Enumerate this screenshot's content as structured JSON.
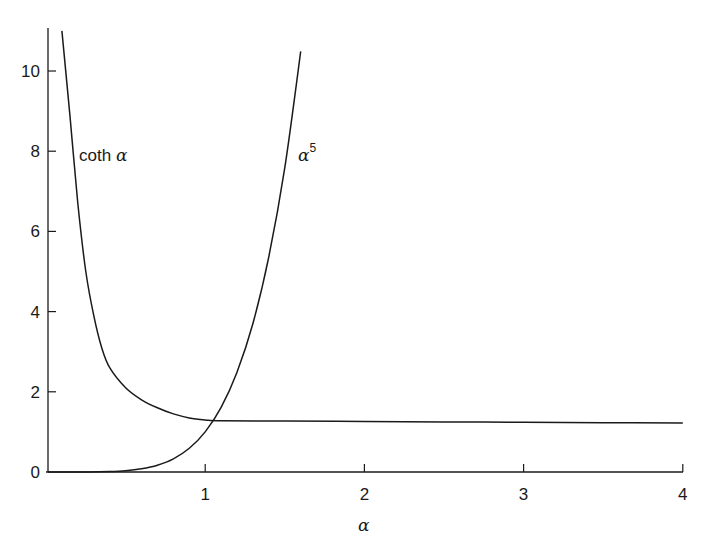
{
  "chart_data": {
    "type": "line",
    "title": "",
    "xlabel": "α",
    "ylabel": "",
    "xlim": [
      0,
      4
    ],
    "ylim": [
      0,
      11
    ],
    "grid": false,
    "legend": "none (inline curve labels)",
    "x_ticks": [
      "1",
      "2",
      "3",
      "4"
    ],
    "y_ticks": [
      "0",
      "2",
      "4",
      "6",
      "8",
      "10"
    ],
    "series": [
      {
        "name": "coth α",
        "label_text": "coth",
        "label_symbol": "α",
        "x": [
          0.1,
          0.15,
          0.2,
          0.25,
          0.3,
          0.35,
          0.4,
          0.5,
          0.6,
          0.7,
          0.8,
          0.9,
          1.0,
          1.1,
          1.5,
          2.0,
          2.5,
          3.0,
          3.5,
          4.0
        ],
        "y": [
          11.0,
          8.9,
          6.7,
          5.0,
          3.9,
          3.1,
          2.6,
          2.1,
          1.8,
          1.6,
          1.45,
          1.35,
          1.3,
          1.28,
          1.27,
          1.26,
          1.25,
          1.24,
          1.23,
          1.22
        ]
      },
      {
        "name": "α^5",
        "label_text": "α",
        "label_superscript": "5",
        "x": [
          0.0,
          0.2,
          0.4,
          0.5,
          0.6,
          0.7,
          0.8,
          0.9,
          1.0,
          1.1,
          1.2,
          1.3,
          1.4,
          1.5,
          1.6
        ],
        "y": [
          0.0,
          0.0003,
          0.01,
          0.03,
          0.08,
          0.17,
          0.33,
          0.59,
          1.0,
          1.61,
          2.49,
          3.71,
          5.38,
          7.59,
          10.49
        ]
      }
    ],
    "annotations": [
      {
        "text": "coth α",
        "x": 0.2,
        "y": 7.9
      },
      {
        "text": "α^5",
        "x": 1.6,
        "y": 7.9
      }
    ]
  },
  "labels": {
    "x_axis": "α",
    "coth_text": "coth",
    "coth_symbol": "α",
    "power_symbol": "α",
    "power_exp": "5"
  }
}
